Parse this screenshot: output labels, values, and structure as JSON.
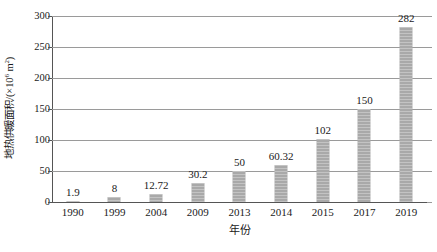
{
  "chart_data": {
    "type": "bar",
    "title": "",
    "xlabel": "年份",
    "ylabel_text": "地热供暖面积/(×10",
    "ylabel_exponent": "6",
    "ylabel_tail": " m",
    "ylabel_unit_exponent": "2",
    "ylabel_close": ")",
    "ylabel_full": "地热供暖面积/(×10⁶ m²)",
    "categories": [
      "1990",
      "1999",
      "2004",
      "2009",
      "2013",
      "2014",
      "2015",
      "2017",
      "2019"
    ],
    "values": [
      1.9,
      8,
      12.72,
      30.2,
      50,
      60.32,
      102,
      150,
      282
    ],
    "value_labels": [
      "1.9",
      "8",
      "12.72",
      "30.2",
      "50",
      "60.32",
      "102",
      "150",
      "282"
    ],
    "ylim": [
      0,
      300
    ],
    "yticks": [
      0,
      50,
      100,
      150,
      200,
      250,
      300
    ],
    "ytick_labels": [
      "0",
      "50",
      "100",
      "150",
      "200",
      "250",
      "300"
    ],
    "grid": true,
    "legend": "none",
    "bar_color": "#a9a9a9",
    "axis_color": "#555555",
    "grid_color": "#9a9a9a",
    "background": "#ffffff"
  }
}
